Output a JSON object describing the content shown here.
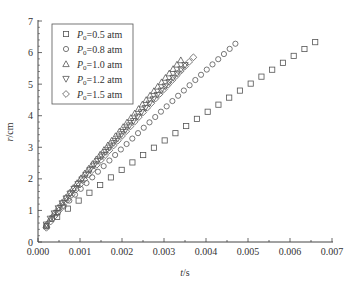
{
  "chart_data": {
    "type": "scatter",
    "title": "",
    "xlabel": "t/s",
    "ylabel": "r/cm",
    "xlim": [
      0.0,
      0.007
    ],
    "ylim": [
      0,
      7
    ],
    "xticks": [
      "0.000",
      "0.001",
      "0.002",
      "0.003",
      "0.004",
      "0.005",
      "0.006",
      "0.007"
    ],
    "yticks": [
      "0",
      "1",
      "2",
      "3",
      "4",
      "5",
      "6",
      "7"
    ],
    "grid": false,
    "legend_position": "upper-left",
    "series": [
      {
        "name": "P0=0.5 atm",
        "label_main": "P",
        "label_sub": "0",
        "label_rest": "=0.5 atm",
        "marker": "square",
        "t_start": 0.0002,
        "r_start": 0.5,
        "t_end": 0.0066,
        "r_end": 6.33,
        "n_points": 26
      },
      {
        "name": "P0=0.8 atm",
        "label_main": "P",
        "label_sub": "0",
        "label_rest": "=0.8 atm",
        "marker": "circle",
        "t_start": 0.0002,
        "r_start": 0.5,
        "t_end": 0.0047,
        "r_end": 6.28,
        "n_points": 34
      },
      {
        "name": "P0=1.0 atm",
        "label_main": "P",
        "label_sub": "0",
        "label_rest": "=1.0 atm",
        "marker": "triangle-up",
        "t_start": 0.0002,
        "r_start": 0.55,
        "t_end": 0.0034,
        "r_end": 5.76,
        "n_points": 36
      },
      {
        "name": "P0=1.2 atm",
        "label_main": "P",
        "label_sub": "0",
        "label_rest": "=1.2 atm",
        "marker": "triangle-down",
        "t_start": 0.0002,
        "r_start": 0.55,
        "t_end": 0.0035,
        "r_end": 5.6,
        "n_points": 36
      },
      {
        "name": "P0=1.5 atm",
        "label_main": "P",
        "label_sub": "0",
        "label_rest": "=1.5 atm",
        "marker": "diamond",
        "t_start": 0.0002,
        "r_start": 0.45,
        "t_end": 0.0037,
        "r_end": 5.85,
        "n_points": 36
      }
    ]
  },
  "style": {
    "marker_color": "#555555",
    "axis_color": "#444444"
  }
}
